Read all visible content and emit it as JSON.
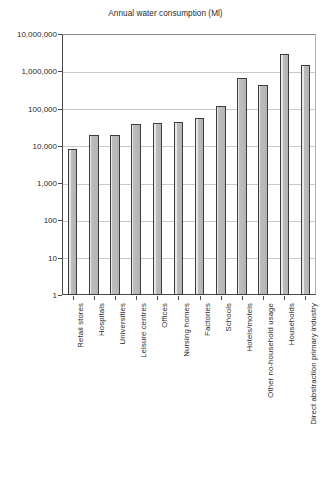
{
  "chart_data": {
    "type": "bar",
    "title": "Annual water consumption (Ml)",
    "xlabel": "",
    "ylabel": "",
    "yscale": "log",
    "ylim": [
      1,
      10000000
    ],
    "grid": true,
    "legend": "none",
    "ytick_labels": [
      "10,000,000",
      "1,000,000",
      "100,000",
      "10,000",
      "1,000",
      "100",
      "10",
      "1"
    ],
    "ytick_values": [
      10000000,
      1000000,
      100000,
      10000,
      1000,
      100,
      10,
      1
    ],
    "categories": [
      "Retail stores",
      "Hospitals",
      "Universities",
      "Leisure centres",
      "Offices",
      "Nursing homes",
      "Factories",
      "Schools",
      "Hotels/motels",
      "Other no-household usage",
      "Households",
      "Direct abstraction primary industry"
    ],
    "values": [
      8000,
      19000,
      20000,
      38000,
      42000,
      45000,
      55000,
      115000,
      680000,
      440000,
      3000000,
      1450000
    ],
    "bar_fill_color": "#b4b4b4",
    "bar_edge_color": "#3c3c3c",
    "grid_color": "#c9c9c9",
    "axis_color": "#4a4a4a",
    "background_color": "#ffffff"
  }
}
